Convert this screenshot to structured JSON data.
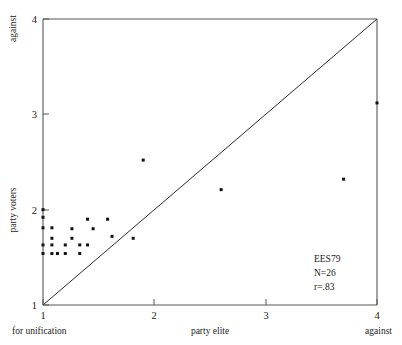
{
  "chart_data": {
    "type": "scatter",
    "title": "",
    "subtitle": "",
    "xlabel": "party elite",
    "ylabel": "party voters",
    "xlim": [
      1,
      4
    ],
    "ylim": [
      1,
      4
    ],
    "xticks": [
      "1",
      "2",
      "3",
      "4"
    ],
    "xtick_values": [
      1,
      2,
      3,
      4
    ],
    "yticks": [
      "1",
      "2",
      "3",
      "4"
    ],
    "ytick_values": [
      1,
      2,
      3,
      4
    ],
    "grid": false,
    "legend": null,
    "x_axis_low_label": "for unification",
    "x_axis_high_label": "against",
    "y_axis_low_label": "for unification",
    "y_axis_high_label": "against",
    "reference_line": {
      "name": "diagonal-identity-line",
      "from": [
        1,
        1
      ],
      "to": [
        4,
        4
      ],
      "label": "y = x"
    },
    "annotations": [
      {
        "name": "dataset-label",
        "text": "EES79"
      },
      {
        "name": "sample-size-label",
        "text": "N=26"
      },
      {
        "name": "correlation-label",
        "text": "r=.83"
      }
    ],
    "series": [
      {
        "name": "parties",
        "marker": "square",
        "color": "#111111",
        "points": [
          [
            1.0,
            2.0
          ],
          [
            1.0,
            1.92
          ],
          [
            1.0,
            1.81
          ],
          [
            1.0,
            1.63
          ],
          [
            1.0,
            1.54
          ],
          [
            1.08,
            1.7
          ],
          [
            1.08,
            1.63
          ],
          [
            1.08,
            1.54
          ],
          [
            1.2,
            1.63
          ],
          [
            1.2,
            1.54
          ],
          [
            1.26,
            1.8
          ],
          [
            1.26,
            1.7
          ],
          [
            1.33,
            1.63
          ],
          [
            1.4,
            1.9
          ],
          [
            1.4,
            1.63
          ],
          [
            1.45,
            1.8
          ],
          [
            1.58,
            1.9
          ],
          [
            1.62,
            1.72
          ],
          [
            1.81,
            1.7
          ],
          [
            1.9,
            2.52
          ],
          [
            2.6,
            2.21
          ],
          [
            3.7,
            2.32
          ],
          [
            4.0,
            3.12
          ],
          [
            1.13,
            1.54
          ],
          [
            1.33,
            1.54
          ],
          [
            1.08,
            1.81
          ]
        ]
      }
    ]
  },
  "axes": {
    "x_title": "party elite",
    "y_title": "party voters",
    "bottom_left_label": "for unification",
    "bottom_right_label": "against",
    "top_left_label": "against"
  },
  "annotation_box": {
    "dataset": "EES79",
    "n": "N=26",
    "r": "r=.83"
  },
  "ticks": {
    "x": [
      "1",
      "2",
      "3",
      "4"
    ],
    "y_top": "4",
    "y_3": "3",
    "y_2": "2",
    "y_1": "1"
  }
}
